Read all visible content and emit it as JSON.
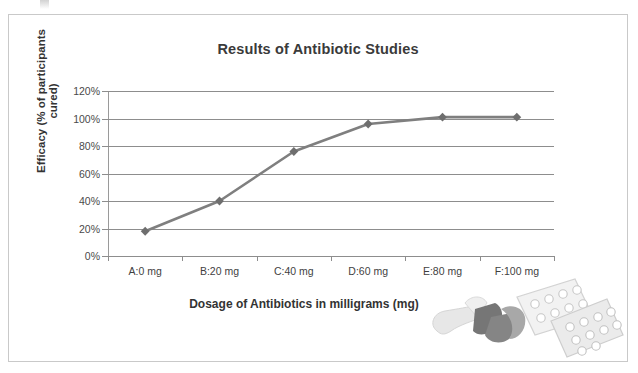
{
  "chart_data": {
    "type": "line",
    "title": "Results of Antibiotic Studies",
    "xlabel": "Dosage of Antibiotics in milligrams (mg)",
    "ylabel": "Efficacy (% of participants cured)",
    "categories": [
      "A:0 mg",
      "B:20 mg",
      "C:40 mg",
      "D:60 mg",
      "E:80 mg",
      "F:100 mg"
    ],
    "values": [
      18,
      40,
      76,
      96,
      101,
      101
    ],
    "value_labels": [
      "18%",
      "40%",
      "76%",
      "96%",
      "101%",
      "101%"
    ],
    "ylim": [
      0,
      120
    ],
    "ytick_labels": [
      "0%",
      "20%",
      "40%",
      "60%",
      "80%",
      "100%",
      "120%"
    ],
    "ytick_values": [
      0,
      20,
      40,
      60,
      80,
      100,
      120
    ],
    "grid": true,
    "legend": "none",
    "series_color": "#7f7f7f",
    "marker": "diamond",
    "marker_color": "#6e6e6e",
    "gridline_color": "#8d8d8d",
    "title_color": "#3a3a3a"
  },
  "decoration": {
    "pill_art_name": "pills-blister-pack-illustration"
  }
}
